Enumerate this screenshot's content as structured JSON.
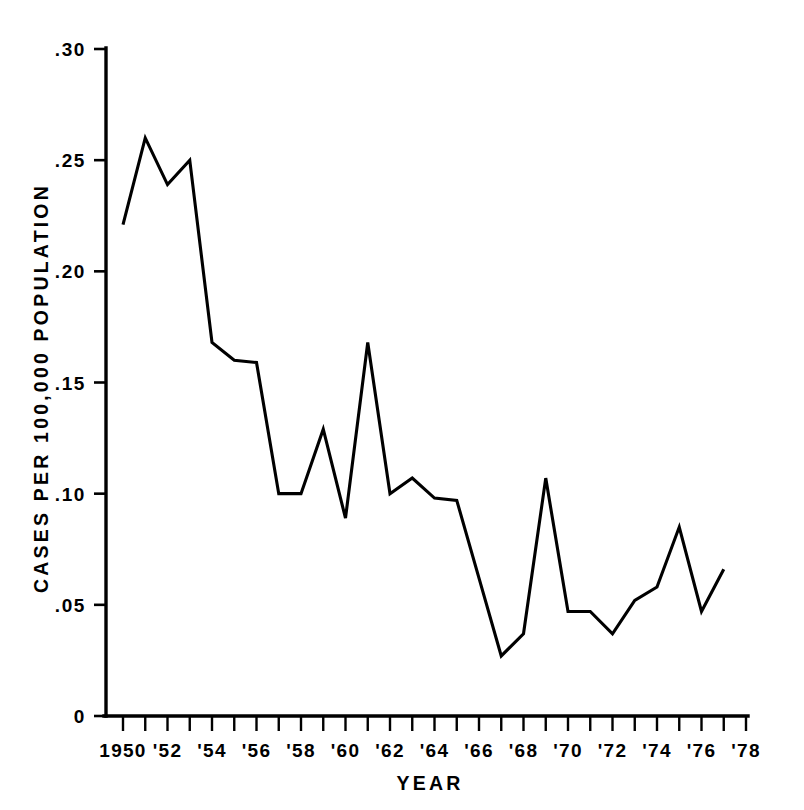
{
  "chart_data": {
    "type": "line",
    "title": "",
    "xlabel": "YEAR",
    "ylabel": "CASES PER 100,000 POPULATION",
    "xlim": [
      1950,
      1978
    ],
    "ylim": [
      0,
      0.3
    ],
    "grid": false,
    "legend": null,
    "y_ticks": [
      0.3,
      0.25,
      0.2,
      0.15,
      0.1,
      0.05,
      0
    ],
    "y_tick_labels": [
      ".30",
      ".25",
      ".20",
      ".15",
      ".10",
      ".05",
      "0"
    ],
    "x_ticks": [
      1950,
      1951,
      1952,
      1953,
      1954,
      1955,
      1956,
      1957,
      1958,
      1959,
      1960,
      1961,
      1962,
      1963,
      1964,
      1965,
      1966,
      1967,
      1968,
      1969,
      1970,
      1971,
      1972,
      1973,
      1974,
      1975,
      1976,
      1977,
      1978
    ],
    "x_tick_labels": [
      {
        "value": 1950,
        "label": "1950"
      },
      {
        "value": 1952,
        "label": "'52"
      },
      {
        "value": 1954,
        "label": "'54"
      },
      {
        "value": 1956,
        "label": "'56"
      },
      {
        "value": 1958,
        "label": "'58"
      },
      {
        "value": 1960,
        "label": "'60"
      },
      {
        "value": 1962,
        "label": "'62"
      },
      {
        "value": 1964,
        "label": "'64"
      },
      {
        "value": 1966,
        "label": "'66"
      },
      {
        "value": 1968,
        "label": "'68"
      },
      {
        "value": 1970,
        "label": "'70"
      },
      {
        "value": 1972,
        "label": "'72"
      },
      {
        "value": 1974,
        "label": "'74"
      },
      {
        "value": 1976,
        "label": "'76"
      },
      {
        "value": 1978,
        "label": "'78"
      }
    ],
    "x": [
      1950,
      1951,
      1952,
      1953,
      1954,
      1955,
      1956,
      1957,
      1958,
      1959,
      1960,
      1961,
      1962,
      1963,
      1964,
      1965,
      1966,
      1967,
      1968,
      1969,
      1970,
      1971,
      1972,
      1973,
      1974,
      1975,
      1976,
      1977
    ],
    "values": [
      0.221,
      0.26,
      0.239,
      0.25,
      0.168,
      0.16,
      0.159,
      0.1,
      0.1,
      0.129,
      0.089,
      0.168,
      0.1,
      0.107,
      0.098,
      0.097,
      0.062,
      0.027,
      0.037,
      0.107,
      0.047,
      0.047,
      0.037,
      0.052,
      0.058,
      0.085,
      0.047,
      0.066
    ],
    "series": [
      {
        "name": "Cases per 100,000 population",
        "color": "#000000",
        "values": [
          0.221,
          0.26,
          0.239,
          0.25,
          0.168,
          0.16,
          0.159,
          0.1,
          0.1,
          0.129,
          0.089,
          0.168,
          0.1,
          0.107,
          0.098,
          0.097,
          0.062,
          0.027,
          0.037,
          0.107,
          0.047,
          0.047,
          0.037,
          0.052,
          0.058,
          0.085,
          0.047,
          0.066
        ]
      }
    ]
  }
}
